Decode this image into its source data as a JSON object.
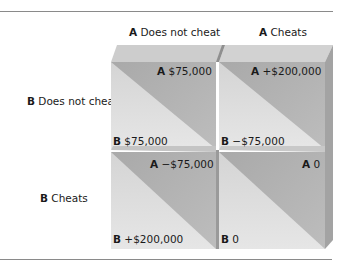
{
  "columns": [
    {
      "player": "A",
      "strategy": "Does not cheat"
    },
    {
      "player": "A",
      "strategy": "Cheats"
    }
  ],
  "rows": [
    {
      "player": "B",
      "strategy": "Does not cheat"
    },
    {
      "player": "B",
      "strategy": "Cheats"
    }
  ],
  "cells": [
    [
      {
        "a_player": "A",
        "a_payoff": "$75,000",
        "b_player": "B",
        "b_payoff": "$75,000"
      },
      {
        "a_player": "A",
        "a_payoff": "+$200,000",
        "b_player": "B",
        "b_payoff": "−$75,000"
      }
    ],
    [
      {
        "a_player": "A",
        "a_payoff": "−$75,000",
        "b_player": "B",
        "b_payoff": "+$200,000"
      },
      {
        "a_player": "A",
        "a_payoff": "0",
        "b_player": "B",
        "b_payoff": "0"
      }
    ]
  ],
  "colors": {
    "face_light": "#dcdcdc",
    "face_dark": "#b4b4b4",
    "bevel_top": "#cfcfcf",
    "bevel_side": "#9e9e9e",
    "rule": "#8a8a8a"
  }
}
